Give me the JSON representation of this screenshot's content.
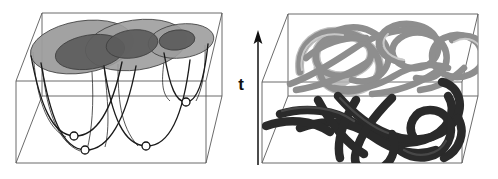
{
  "figure": {
    "title": "",
    "panels": [
      {
        "id": "left-panel",
        "name": "energy-landscape-panel",
        "description": "Wireframe box containing three overlapping shaded discs (basins) above parabolic potential wells with open-circle minima markers",
        "box": {
          "front_bottom_left": [
            16,
            163
          ],
          "front_bottom_right": [
            206,
            163
          ],
          "front_top_left": [
            16,
            81
          ],
          "front_top_right": [
            206,
            81
          ],
          "back_bottom_left": [
            42,
            96
          ],
          "back_bottom_right": [
            222,
            96
          ],
          "back_top_left": [
            42,
            13
          ],
          "back_top_right": [
            222,
            13
          ],
          "stroke": "#4a4a4a",
          "stroke_width": 0.9
        },
        "discs": [
          {
            "name": "disc-outer-left",
            "cx": 82,
            "cy": 47,
            "rx": 52,
            "ry": 26,
            "rot": -9,
            "fill": "#9d9d9d"
          },
          {
            "name": "disc-outer-mid",
            "cx": 136,
            "cy": 45,
            "rx": 51,
            "ry": 25,
            "rot": -8,
            "fill": "#9d9d9d"
          },
          {
            "name": "disc-outer-right",
            "cx": 181,
            "cy": 41,
            "rx": 33,
            "ry": 17,
            "rot": -7,
            "fill": "#9d9d9d"
          },
          {
            "name": "disc-inner-left",
            "cx": 90,
            "cy": 52,
            "rx": 35,
            "ry": 17,
            "rot": -9,
            "fill": "#5c5c5c"
          },
          {
            "name": "disc-inner-mid",
            "cx": 132,
            "cy": 44,
            "rx": 26,
            "ry": 14,
            "rot": -8,
            "fill": "#5c5c5c"
          },
          {
            "name": "disc-inner-right",
            "cx": 177,
            "cy": 40,
            "rx": 18,
            "ry": 10,
            "rot": -7,
            "fill": "#5c5c5c"
          }
        ],
        "wells": [
          {
            "name": "well-1",
            "minimum": [
              74,
              136
            ]
          },
          {
            "name": "well-2",
            "minimum": [
              85,
              150
            ]
          },
          {
            "name": "well-3",
            "minimum": [
              146,
              146
            ]
          },
          {
            "name": "well-4",
            "minimum": [
              186,
              102
            ]
          }
        ],
        "curve_stroke": "#1a1a1a",
        "marker_fill": "#ffffff",
        "marker_radius": 4
      },
      {
        "id": "right-panel",
        "name": "polymer-knot-panel",
        "description": "Wireframe box containing an upper light-gray tangled tube configuration and a lower dark tangled tube configuration",
        "box": {
          "front_bottom_left": [
            262,
            163
          ],
          "front_bottom_right": [
            462,
            163
          ],
          "front_top_left": [
            262,
            82
          ],
          "front_top_right": [
            462,
            82
          ],
          "back_bottom_left": [
            288,
            96
          ],
          "back_bottom_right": [
            478,
            96
          ],
          "back_top_left": [
            288,
            14
          ],
          "back_top_right": [
            478,
            14
          ],
          "stroke": "#4a4a4a",
          "stroke_width": 0.9
        },
        "tubes": [
          {
            "name": "tube-upper-chain",
            "color": "#8e8e8e",
            "highlight": "#c9c9c9",
            "width": 7
          },
          {
            "name": "tube-lower-chain",
            "color": "#2b2b2b",
            "highlight": "#444444",
            "width": 9
          }
        ]
      }
    ],
    "axis": {
      "name": "time-axis",
      "label": "t",
      "arrow": {
        "x": 258,
        "y_tail": 165,
        "y_head": 33,
        "stroke": "#111111",
        "stroke_width": 1.6
      },
      "label_position": [
        241,
        90
      ]
    }
  }
}
